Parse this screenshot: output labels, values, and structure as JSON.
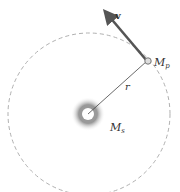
{
  "diagram": {
    "velocity_label": "v",
    "planet_label": "M",
    "planet_sub": "p",
    "radius_label": "r",
    "star_label": "M",
    "star_sub": "s",
    "colors": {
      "orbit": "#b0b0b0",
      "arrow": "#555555",
      "line": "#444444",
      "glow": "#888888"
    }
  }
}
